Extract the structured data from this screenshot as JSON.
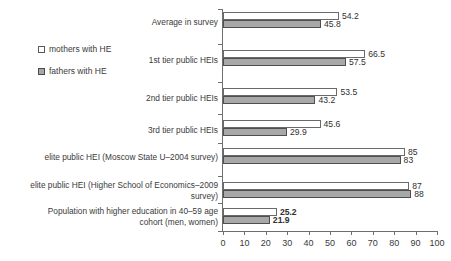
{
  "chart_data": {
    "type": "bar",
    "orientation": "horizontal",
    "title": "",
    "xlabel": "",
    "ylabel": "",
    "xlim": [
      0,
      100
    ],
    "xticks": [
      0,
      10,
      20,
      30,
      40,
      50,
      60,
      70,
      80,
      90,
      100
    ],
    "grid": false,
    "legend_position": "left",
    "categories": [
      "Average in survey",
      "1st tier public HEIs",
      "2nd tier public HEIs",
      "3rd tier public HEIs",
      "elite public HEI (Moscow State U–2004 survey)",
      "elite public HEI (Higher School of Economics–2009\nsurvey)",
      "Population with higher education in 40–59 age\ncohort (men, women)"
    ],
    "series": [
      {
        "name": "mothers with HE",
        "swatch": "hollow-square",
        "color": "#ffffff",
        "values": [
          54.2,
          66.5,
          53.5,
          45.6,
          85,
          87,
          25.2
        ],
        "labels": [
          "54.2",
          "66.5",
          "53.5",
          "45.6",
          "85",
          "87",
          "25.2"
        ],
        "label_bold": [
          false,
          false,
          false,
          false,
          false,
          false,
          true
        ]
      },
      {
        "name": "fathers with HE",
        "swatch": "filled-square",
        "color": "#a8a8a8",
        "values": [
          45.8,
          57.5,
          43.2,
          29.9,
          83,
          88,
          21.9
        ],
        "labels": [
          "45.8",
          "57.5",
          "43.2",
          "29.9",
          "83",
          "88",
          "21.9"
        ],
        "label_bold": [
          false,
          false,
          false,
          false,
          false,
          false,
          true
        ]
      }
    ]
  },
  "legend": {
    "items": [
      {
        "label": "mothers with HE"
      },
      {
        "label": "fathers with HE"
      }
    ]
  }
}
